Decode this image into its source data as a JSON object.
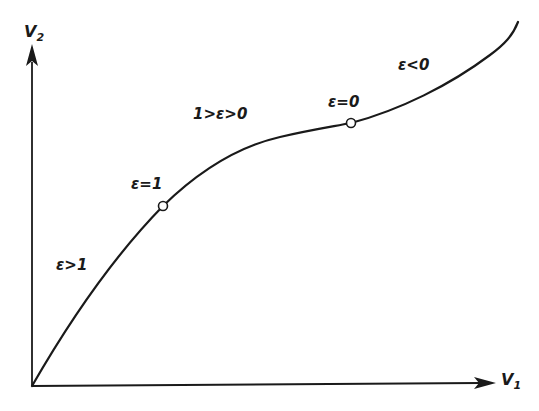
{
  "diagram": {
    "axes": {
      "x": {
        "symbol": "V",
        "subscript": "1"
      },
      "y": {
        "symbol": "V",
        "subscript": "2"
      }
    },
    "regions": [
      {
        "id": "eps-gt-1",
        "label": "ε>1"
      },
      {
        "id": "eps-between",
        "label": "1>ε>0"
      },
      {
        "id": "eps-lt-0",
        "label": "ε<0"
      }
    ],
    "points": [
      {
        "id": "eps-eq-1",
        "label": "ε=1"
      },
      {
        "id": "eps-eq-0",
        "label": "ε=0"
      }
    ],
    "colors": {
      "ink": "#1a1a1a",
      "background": "#ffffff"
    }
  }
}
